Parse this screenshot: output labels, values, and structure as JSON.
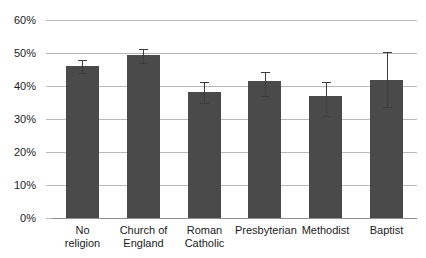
{
  "chart_data": {
    "type": "bar",
    "title": "",
    "subtitle": "",
    "xlabel": "",
    "ylabel": "",
    "categories": [
      "No\nreligion",
      "Church of\nEngland",
      "Roman\nCatholic",
      "Presbyterian",
      "Methodist",
      "Baptist"
    ],
    "values": [
      46.0,
      49.5,
      38.2,
      41.5,
      37.0,
      41.8
    ],
    "error_low": [
      44.0,
      47.0,
      34.8,
      37.0,
      31.0,
      33.6
    ],
    "error_high": [
      47.8,
      51.3,
      41.3,
      44.3,
      41.3,
      50.2
    ],
    "ylim": [
      0,
      60
    ],
    "ytick_values": [
      0,
      10,
      20,
      30,
      40,
      50,
      60
    ],
    "ytick_labels": [
      "0%",
      "10%",
      "20%",
      "30%",
      "40%",
      "50%",
      "60%"
    ],
    "grid": "horizontal",
    "legend": "none",
    "bar_color": "#4a4a4a",
    "grid_color": "#b9b9b9",
    "axis_color": "#8e8e8e",
    "error_color": "#3c3c3c",
    "text_color": "#1b1b1b"
  }
}
